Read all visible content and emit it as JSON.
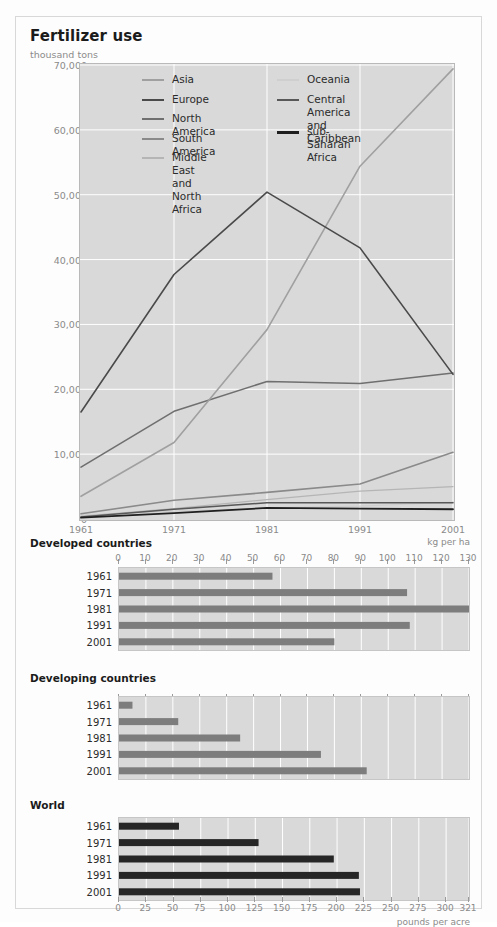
{
  "header": {
    "title": "Fertilizer use",
    "subtitle": "thousand tons"
  },
  "chart_data": [
    {
      "type": "line",
      "title": "Fertilizer use",
      "ylabel": "thousand tons",
      "xlabel": "",
      "x": [
        1961,
        1971,
        1981,
        1991,
        2001
      ],
      "xtick_labels": [
        "1961",
        "1971",
        "1981",
        "1991",
        "2001"
      ],
      "ytick_labels": [
        "0",
        "10,000",
        "20,000",
        "30,000",
        "40,000",
        "50,000",
        "60,000",
        "70,000"
      ],
      "ytick_values": [
        0,
        10000,
        20000,
        30000,
        40000,
        50000,
        60000,
        70000
      ],
      "ylim": [
        0,
        70000
      ],
      "xlim": [
        1961,
        2001
      ],
      "grid": true,
      "legend_position": "top-left-inside",
      "series": [
        {
          "name": "Asia",
          "color": "#a0a0a0",
          "width": 1.6,
          "values": [
            3500,
            11800,
            29200,
            54400,
            69400
          ]
        },
        {
          "name": "Europe",
          "color": "#4a4a4a",
          "width": 1.6,
          "values": [
            16500,
            37700,
            50400,
            41800,
            22300
          ]
        },
        {
          "name": "North America",
          "color": "#6f6f6f",
          "width": 1.6,
          "values": [
            8000,
            16600,
            21200,
            20900,
            22500
          ]
        },
        {
          "name": "South America",
          "color": "#8a8a8a",
          "width": 1.6,
          "values": [
            800,
            2900,
            4100,
            5400,
            10300
          ]
        },
        {
          "name": "Middle East and North Africa",
          "color": "#b5b5b5",
          "width": 1.3,
          "values": [
            400,
            1600,
            3000,
            4300,
            5000
          ]
        },
        {
          "name": "Oceania",
          "color": "#cfcfcf",
          "width": 1.3,
          "values": [
            600,
            1200,
            1700,
            2000,
            2600
          ]
        },
        {
          "name": "Central America and Caribbean",
          "color": "#585858",
          "width": 1.6,
          "values": [
            300,
            1500,
            2500,
            2500,
            2500
          ]
        },
        {
          "name": "sub-Saharan Africa",
          "color": "#1f1f1f",
          "width": 1.8,
          "values": [
            200,
            900,
            1700,
            1600,
            1500
          ]
        }
      ],
      "legend_left": [
        "Asia",
        "Europe",
        "North America",
        "South America",
        "Middle East and\nNorth Africa"
      ],
      "legend_right": [
        "Oceania",
        "Central America\nand Caribbean",
        "sub-Saharan Africa"
      ]
    },
    {
      "type": "bar",
      "orientation": "horizontal",
      "title": "Developed countries",
      "unit": "kg per ha",
      "categories": [
        "1961",
        "1971",
        "1981",
        "1991",
        "2001"
      ],
      "values": [
        57,
        107,
        132,
        108,
        80
      ],
      "xlim": [
        0,
        130
      ],
      "xtick_values": [
        0,
        10,
        20,
        30,
        40,
        50,
        60,
        70,
        80,
        90,
        100,
        110,
        120,
        130
      ],
      "xtick_labels": [
        "0",
        "10",
        "20",
        "30",
        "40",
        "50",
        "60",
        "70",
        "80",
        "90",
        "100",
        "110",
        "120",
        "130"
      ],
      "bar_color": "#7d7d7d",
      "grid": true
    },
    {
      "type": "bar",
      "orientation": "horizontal",
      "title": "Developing countries",
      "unit": "",
      "categories": [
        "1961",
        "1971",
        "1981",
        "1991",
        "2001"
      ],
      "values": [
        5,
        22,
        45,
        75,
        92
      ],
      "xlim": [
        0,
        130
      ],
      "xtick_values": [
        0,
        10,
        20,
        30,
        40,
        50,
        60,
        70,
        80,
        90,
        100,
        110,
        120,
        130
      ],
      "xtick_labels": [
        "",
        "",
        "",
        "",
        "",
        "",
        "",
        "",
        "",
        "",
        "",
        "",
        "",
        ""
      ],
      "bar_color": "#7d7d7d",
      "grid": true
    },
    {
      "type": "bar",
      "orientation": "horizontal",
      "title": "World",
      "unit": "pounds per acre",
      "categories": [
        "1961",
        "1971",
        "1981",
        "1991",
        "2001"
      ],
      "values": [
        55,
        128,
        197,
        220,
        221
      ],
      "xlim": [
        0,
        321
      ],
      "xtick_values": [
        0,
        25,
        50,
        75,
        100,
        125,
        150,
        175,
        200,
        225,
        250,
        275,
        300,
        321
      ],
      "xtick_labels": [
        "0",
        "25",
        "50",
        "75",
        "100",
        "125",
        "150",
        "175",
        "200",
        "225",
        "250",
        "275",
        "300",
        "321"
      ],
      "bar_color": "#262626",
      "grid": true
    }
  ],
  "colors": {
    "panel_bg": "#d9d9d9",
    "page_bg": "#fdfdfd",
    "grid": "#ffffff",
    "tick_text": "#8a8a8a",
    "label_text": "#2b2b2b"
  }
}
